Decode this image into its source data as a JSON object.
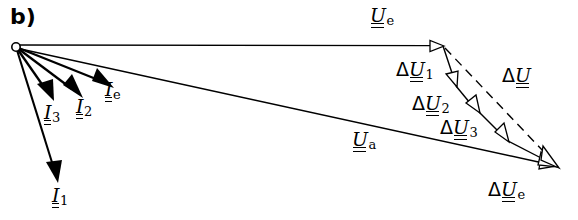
{
  "figure": {
    "panel_label": "b)",
    "type": "phasor-vector-diagram",
    "background": "#ffffff",
    "stroke_color": "#000000",
    "width": 578,
    "height": 220
  },
  "origin": {
    "x": 16,
    "y": 47,
    "marker": "open-circle"
  },
  "labels": {
    "I1": {
      "delta": "",
      "symbol": "I",
      "sub": "1"
    },
    "I2": {
      "delta": "",
      "symbol": "I",
      "sub": "2"
    },
    "I3": {
      "delta": "",
      "symbol": "I",
      "sub": "3"
    },
    "Ie": {
      "delta": "",
      "symbol": "I",
      "sub": "e"
    },
    "Ue": {
      "delta": "",
      "symbol": "U",
      "sub": "e"
    },
    "Ua": {
      "delta": "",
      "symbol": "U",
      "sub": "a"
    },
    "dU": {
      "delta": "Δ",
      "symbol": "U",
      "sub": ""
    },
    "dU1": {
      "delta": "Δ",
      "symbol": "U",
      "sub": "1"
    },
    "dU2": {
      "delta": "Δ",
      "symbol": "U",
      "sub": "2"
    },
    "dU3": {
      "delta": "Δ",
      "symbol": "U",
      "sub": "3"
    },
    "dUe": {
      "delta": "Δ",
      "symbol": "U",
      "sub": "e"
    }
  },
  "vectors": [
    {
      "name": "I1",
      "from": [
        16,
        47
      ],
      "to": [
        58,
        183
      ],
      "arrowhead": "filled",
      "style": "solid",
      "stroke": 2.0
    },
    {
      "name": "I3",
      "from": [
        16,
        47
      ],
      "to": [
        52,
        100
      ],
      "arrowhead": "filled",
      "style": "solid",
      "stroke": 2.2
    },
    {
      "name": "I2",
      "from": [
        16,
        47
      ],
      "to": [
        81,
        97
      ],
      "arrowhead": "filled",
      "style": "solid",
      "stroke": 2.2
    },
    {
      "name": "Ie",
      "from": [
        16,
        47
      ],
      "to": [
        112,
        88
      ],
      "arrowhead": "filled",
      "style": "solid",
      "stroke": 2.2
    },
    {
      "name": "Ue",
      "from": [
        16,
        45
      ],
      "to": [
        443,
        46
      ],
      "arrowhead": "hollow",
      "style": "solid",
      "stroke": 1.4
    },
    {
      "name": "Ua",
      "from": [
        16,
        48
      ],
      "to": [
        556,
        166
      ],
      "arrowhead": "hollow",
      "style": "solid",
      "stroke": 1.4
    },
    {
      "name": "dU1",
      "from": [
        443,
        46
      ],
      "to": [
        456,
        86
      ],
      "arrowhead": "hollow",
      "style": "solid",
      "stroke": 1.4
    },
    {
      "name": "dU2",
      "from": [
        456,
        86
      ],
      "to": [
        479,
        112
      ],
      "arrowhead": "hollow",
      "style": "solid",
      "stroke": 1.4
    },
    {
      "name": "dU3",
      "from": [
        479,
        112
      ],
      "to": [
        508,
        141
      ],
      "arrowhead": "hollow",
      "style": "solid",
      "stroke": 1.4
    },
    {
      "name": "dUe",
      "from": [
        508,
        141
      ],
      "to": [
        556,
        166
      ],
      "arrowhead": "hollow",
      "style": "solid",
      "stroke": 1.4
    },
    {
      "name": "dU",
      "from": [
        443,
        46
      ],
      "to": [
        558,
        167
      ],
      "arrowhead": "hollow",
      "style": "dashed",
      "stroke": 1.4
    }
  ],
  "label_positions": {
    "panel": [
      10,
      6
    ],
    "I1": [
      52,
      186
    ],
    "I2": [
      76,
      100
    ],
    "I3": [
      44,
      103
    ],
    "Ie": [
      105,
      84
    ],
    "Ue": [
      370,
      6
    ],
    "Ua": [
      352,
      131
    ],
    "dU": [
      502,
      68
    ],
    "dU1": [
      398,
      62
    ],
    "dU2": [
      413,
      96
    ],
    "dU3": [
      441,
      120
    ],
    "dUe": [
      489,
      181
    ]
  }
}
